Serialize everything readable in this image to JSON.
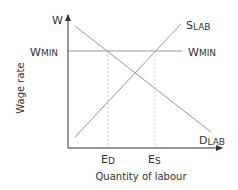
{
  "diagram": {
    "y_axis_label": "Wage rate",
    "x_axis_label": "Quantity of labour",
    "y_axis_symbol": "W",
    "min_wage_label_left": {
      "main": "W",
      "sub": "MIN"
    },
    "min_wage_label_right": {
      "main": "W",
      "sub": "MIN"
    },
    "supply_label": {
      "main": "S",
      "sub": "LAB"
    },
    "demand_label": {
      "main": "D",
      "sub": "LAB"
    },
    "employment_demanded_label": {
      "main": "E",
      "sub": "D"
    },
    "employment_supplied_label": {
      "main": "E",
      "sub": "S"
    },
    "colors": {
      "axis": "#333333",
      "curve": "#9a9a9a",
      "guide": "#c8c8c8",
      "text": "#333333"
    }
  }
}
